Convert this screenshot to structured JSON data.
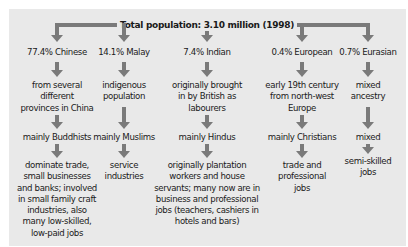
{
  "diagram": {
    "title": "Total population: 3.10 million (1998)",
    "colors": {
      "panel": "#e9e9e9",
      "arrow": "#7a7a7a",
      "text": "#1a1a1a"
    },
    "groups": [
      {
        "label": "77.4% Chinese",
        "origin": [
          "from several",
          "different",
          "provinces in China"
        ],
        "religion": "mainly Buddhists",
        "occupation": [
          "dominate trade,",
          "small businesses",
          "and banks; involved",
          "in small family craft",
          "industries, also",
          "many low-skilled,",
          "low-paid jobs"
        ]
      },
      {
        "label": "14.1% Malay",
        "origin": [
          "indigenous",
          "population"
        ],
        "religion": "mainly Muslims",
        "occupation": [
          "service",
          "industries"
        ]
      },
      {
        "label": "7.4% Indian",
        "origin": [
          "originally brought",
          "in by British as",
          "labourers"
        ],
        "religion": "mainly Hindus",
        "occupation": [
          "originally plantation",
          "workers and house",
          "servants; many now are in",
          "business and professional",
          "jobs (teachers, cashiers in",
          "hotels and bars)"
        ]
      },
      {
        "label": "0.4% European",
        "origin": [
          "early 19th century",
          "from north-west",
          "Europe"
        ],
        "religion": "mainly Christians",
        "occupation": [
          "trade and",
          "professional",
          "jobs"
        ]
      },
      {
        "label": "0.7% Eurasian",
        "origin": [
          "mixed",
          "ancestry"
        ],
        "religion": "mixed",
        "occupation": [
          "semi-skilled",
          "jobs"
        ]
      }
    ]
  }
}
